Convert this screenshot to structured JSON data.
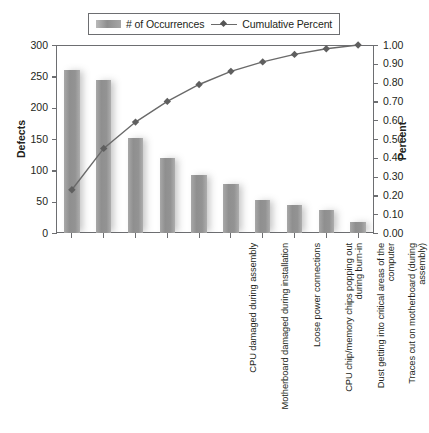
{
  "legend": {
    "items": [
      {
        "label": "# of Occurrences",
        "marker": "bar-swatch-icon",
        "color": "#949494"
      },
      {
        "label": "Cumulative Percent",
        "marker": "line-diamond-icon",
        "color": "#6a6a6a"
      }
    ]
  },
  "axes": {
    "left": {
      "title": "Defects",
      "ticks": [
        "300",
        "250",
        "200",
        "150",
        "100",
        "50",
        "0"
      ],
      "min": 0,
      "max": 300,
      "step": 50
    },
    "right": {
      "title": "Percent",
      "ticks": [
        "1.00",
        "0.90",
        "0.80",
        "0.70",
        "0.60",
        "0.50",
        "0.40",
        "0.30",
        "0.20",
        "0.10",
        "0.00"
      ],
      "min": 0,
      "max": 1,
      "step": 0.1
    }
  },
  "chart_data": {
    "type": "bar",
    "title": "",
    "subtitle": "",
    "xlabel": "",
    "ylabel": "Defects",
    "y2label": "Percent",
    "ylim": [
      0,
      300
    ],
    "y2lim": [
      0,
      1.0
    ],
    "grid": false,
    "legend_position": "top",
    "categories": [
      "CPU damaged during assembly",
      "Motherboard damaged during installation",
      "Loose power connections",
      "CPU chip/memory chips popping out during burn-in",
      "Dust getting into critical areas of the computer",
      "Traces cut on motherboard (during assembly)",
      "Wrong components put on computer",
      "Chips inserted incorrectly",
      "Connections not made on motherboard",
      "Motherboard incorrectly seated"
    ],
    "series": [
      {
        "name": "# of Occurrences",
        "type": "bar",
        "axis": "left",
        "color": "#949494",
        "values": [
          260,
          244,
          151,
          120,
          92,
          78,
          52,
          45,
          37,
          18
        ]
      },
      {
        "name": "Cumulative Percent",
        "type": "line",
        "axis": "right",
        "color": "#6a6a6a",
        "values": [
          0.23,
          0.45,
          0.59,
          0.7,
          0.79,
          0.86,
          0.91,
          0.95,
          0.98,
          1.0
        ]
      }
    ]
  }
}
